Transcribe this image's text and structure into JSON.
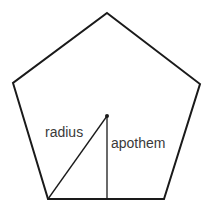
{
  "diagram": {
    "shape": "pentagon",
    "vertices": [
      [
        107,
        13
      ],
      [
        200,
        84
      ],
      [
        164,
        199
      ],
      [
        48,
        199
      ],
      [
        13,
        83
      ]
    ],
    "center": [
      107,
      116
    ],
    "labels": {
      "radius": "radius",
      "apothem": "apothem"
    },
    "colors": {
      "stroke": "#1a1a1a",
      "text": "#3a3a3a",
      "background": "#ffffff"
    }
  }
}
